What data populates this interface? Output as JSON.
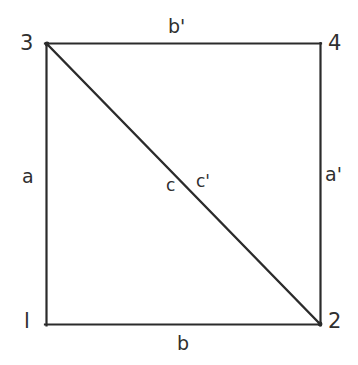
{
  "figure": {
    "background_color": "#ffffff",
    "line_color": "#2b2b2b",
    "text_color": "#2f2f2f",
    "square": {
      "left": 46,
      "top": 43,
      "right": 320,
      "bottom": 325,
      "stroke_width": 2.2
    },
    "diagonal": {
      "from": "3",
      "to": "2",
      "x1": 46,
      "y1": 43,
      "x2": 320,
      "y2": 325,
      "stroke_width": 2.4
    },
    "vertices": [
      {
        "id": "vertex-3",
        "label": "3",
        "corner": "top-left"
      },
      {
        "id": "vertex-4",
        "label": "4",
        "corner": "top-right"
      },
      {
        "id": "vertex-1",
        "label": "l",
        "corner": "bottom-left"
      },
      {
        "id": "vertex-2",
        "label": "2",
        "corner": "bottom-right"
      }
    ],
    "edge_labels": [
      {
        "id": "edge-b-prime",
        "label": "b'",
        "edge": "top",
        "position": "above"
      },
      {
        "id": "edge-b",
        "label": "b",
        "edge": "bottom",
        "position": "below"
      },
      {
        "id": "edge-a",
        "label": "a",
        "edge": "left",
        "position": "left-of"
      },
      {
        "id": "edge-a-prime",
        "label": "a'",
        "edge": "right",
        "position": "right-of"
      }
    ],
    "diagonal_labels": [
      {
        "id": "seg-c",
        "label": "c",
        "position": "left-of-diagonal-midpoint"
      },
      {
        "id": "seg-c-prime",
        "label": "c'",
        "position": "right-of-diagonal-midpoint"
      }
    ]
  }
}
